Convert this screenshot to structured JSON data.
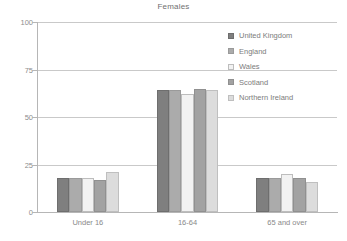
{
  "chart_data": {
    "type": "bar",
    "title": "Females",
    "xlabel": "",
    "ylabel": "",
    "ylim": [
      0,
      100
    ],
    "yticks": [
      0,
      25,
      50,
      75,
      100
    ],
    "grid": true,
    "legend_position": "right-inside-top",
    "categories": [
      "Under 16",
      "16-64",
      "65 and over"
    ],
    "series": [
      {
        "name": "United Kingdom",
        "color": "#7f7f7f",
        "border": "#6e6e6e",
        "values": [
          18,
          64,
          18
        ]
      },
      {
        "name": "England",
        "color": "#ababab",
        "border": "#9a9a9a",
        "values": [
          18,
          64,
          18
        ]
      },
      {
        "name": "Wales",
        "color": "#f2f2f2",
        "border": "#bdbdbd",
        "values": [
          18,
          62,
          20
        ]
      },
      {
        "name": "Scotland",
        "color": "#a2a2a2",
        "border": "#909090",
        "values": [
          17,
          65,
          18
        ]
      },
      {
        "name": "Northern Ireland",
        "color": "#dcdcdc",
        "border": "#bfbfbf",
        "values": [
          21,
          64,
          16
        ]
      }
    ]
  },
  "axis": {
    "tick_labels": [
      "100",
      "75",
      "50",
      "25",
      "0"
    ]
  }
}
